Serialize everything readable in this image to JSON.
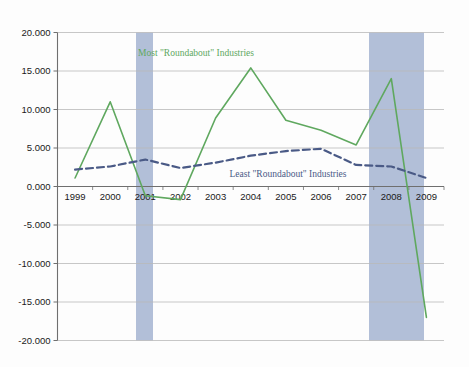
{
  "chart_data": {
    "type": "line",
    "title": "",
    "subtitle": "",
    "xlabel": "",
    "ylabel": "",
    "x": [
      "1999",
      "2000",
      "2001",
      "2002",
      "2003",
      "2004",
      "2005",
      "2006",
      "2007",
      "2008",
      "2009"
    ],
    "categories": [
      "1999",
      "2000",
      "2001",
      "2002",
      "2003",
      "2004",
      "2005",
      "2006",
      "2007",
      "2008",
      "2009"
    ],
    "xtick_labels": [
      "1999",
      "2000",
      "2001",
      "2002",
      "2003",
      "2004",
      "2005",
      "2006",
      "2007",
      "2008",
      "2009"
    ],
    "ytick_labels": [
      "20.000",
      "15.000",
      "10.000",
      "5.000",
      "0.000",
      "-5.000",
      "-10.000",
      "-15.000",
      "-20.000"
    ],
    "ytick_values": [
      20,
      15,
      10,
      5,
      0,
      -5,
      -10,
      -15,
      -20
    ],
    "ylim": [
      -20,
      20
    ],
    "ystep": 5,
    "grid": true,
    "legend_position": "inline-annotations",
    "series": [
      {
        "name": "Most \"Roundabout\" Industries",
        "color": "#5fa85f",
        "style": "solid",
        "values": [
          1.1,
          11.0,
          -1.2,
          -1.7,
          8.9,
          15.4,
          8.6,
          7.3,
          5.4,
          14.0,
          -17.0
        ]
      },
      {
        "name": "Least \"Roundabout\" Industries",
        "color": "#4a5a86",
        "style": "dashed",
        "values": [
          2.2,
          2.6,
          3.5,
          2.4,
          3.1,
          4.0,
          4.6,
          4.9,
          2.8,
          2.6,
          1.1
        ]
      }
    ],
    "annotations": [
      {
        "name": "most-roundabout-label",
        "text": "Most \"Roundabout\" Industries",
        "color": "#5fa85f",
        "x_px": 196,
        "y_px": 56
      },
      {
        "name": "least-roundabout-label",
        "text": "Least \"Roundabout\" Industries",
        "color": "#4a5a86",
        "x_px": 288,
        "y_px": 177
      }
    ],
    "shaded_bands": [
      {
        "name": "recession-band-2001",
        "label": "2001",
        "color": "#aebcd6",
        "x_start_px": 136,
        "x_end_px": 153
      },
      {
        "name": "recession-band-2008",
        "label": "2008-2009",
        "color": "#aebcd6",
        "x_start_px": 369,
        "x_end_px": 424
      }
    ],
    "colors": {
      "green_series": "#5fa85f",
      "blue_series": "#4a5a86",
      "band": "#aebcd6",
      "grid": "#b9b9b9",
      "axis": "#6f6f6f",
      "background": "#fdfdfd"
    }
  }
}
